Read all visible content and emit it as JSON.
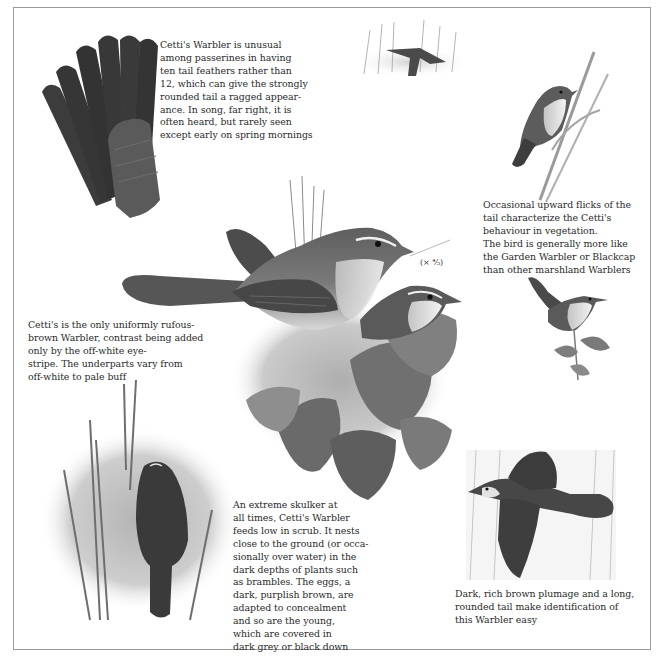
{
  "page": {
    "subject": "Cetti's Warbler",
    "palette": {
      "background": "#ffffff",
      "frame": "#9a9a9a",
      "text": "#2a2a2a",
      "plumage_dark": "#3a3a3a",
      "plumage_mid": "#6b6b6b",
      "underparts": "#e6e6e6",
      "foliage": "#8c8c8c",
      "foliage_light": "#c8c8c8"
    }
  },
  "captions": {
    "tail_feathers": "Cetti's Warbler is unusual\namong passerines in having\nten tail feathers rather than\n12, which can give the strongly\nrounded tail a ragged appear-\nance. In song, far right, it is\noften heard, but rarely seen\nexcept early on spring mornings",
    "tail_flicks": "Occasional upward flicks of the\ntail characterize the Cetti's\nbehaviour in vegetation.\nThe bird is generally more like\nthe Garden Warbler or Blackcap\nthan other marshland Warblers",
    "coloration": "Cetti's is the only uniformly rufous-\nbrown Warbler, contrast being added\nonly by the off-white eye-\nstripe. The underparts vary from\noff-white to pale buff",
    "skulker": "An extreme skulker at\nall times, Cetti's Warbler\nfeeds low in scrub. It nests\nclose to the ground (or occa-\nsionally over water) in the\ndark depths of plants such\nas brambles. The eggs, a\ndark, purplish brown, are\nadapted to concealment\nand so are the young,\nwhich are covered in\ndark grey or black down",
    "flight": "Dark, rich brown plumage and a long,\nrounded tail make identification of\nthis Warbler easy"
  },
  "scale_label": "(× ⁴⁄₅)",
  "illustrations": [
    {
      "id": "tail-fan",
      "label": "spread tail feathers"
    },
    {
      "id": "bird-in-grass-flight",
      "label": "bird low over grass"
    },
    {
      "id": "singing-bird-on-reed",
      "label": "singing bird on reed stem"
    },
    {
      "id": "main-pair",
      "label": "two warblers perched on bramble"
    },
    {
      "id": "bird-tail-cocked",
      "label": "bird with tail flicked upward"
    },
    {
      "id": "bird-at-nest",
      "label": "bird at nest in scrub, seen from behind"
    },
    {
      "id": "bird-in-flight",
      "label": "bird in flight over grass"
    }
  ]
}
